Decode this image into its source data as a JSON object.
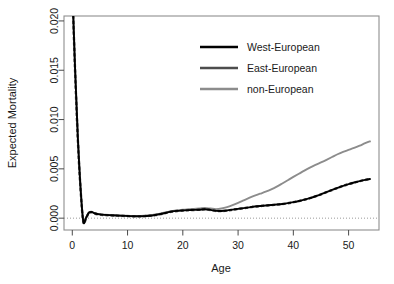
{
  "chart_data": {
    "type": "line",
    "title": "",
    "xlabel": "Age",
    "ylabel": "Expected Mortality",
    "xlim": [
      -1.5,
      55.5
    ],
    "ylim": [
      -0.0012,
      0.0205
    ],
    "xticks": [
      0,
      10,
      20,
      30,
      40,
      50
    ],
    "xtick_labels": [
      "0",
      "10",
      "20",
      "30",
      "40",
      "50"
    ],
    "yticks": [
      0.0,
      0.005,
      0.01,
      0.015,
      0.02
    ],
    "ytick_labels": [
      "0.000",
      "0.005",
      "0.010",
      "0.015",
      "0.020"
    ],
    "grid": false,
    "reference_line": {
      "y": 0.0,
      "style": "dotted",
      "color": "#9a9a9a"
    },
    "legend": {
      "position": "top-center-right",
      "entries": [
        "West-European",
        "East-European",
        "non-European"
      ]
    },
    "x": [
      0,
      0.5,
      1,
      1.5,
      2,
      2.5,
      3,
      3.5,
      4,
      5,
      6,
      7,
      8,
      9,
      10,
      11,
      12,
      13,
      14,
      15,
      16,
      17,
      18,
      19,
      20,
      21,
      22,
      23,
      24,
      25,
      26,
      27,
      28,
      29,
      30,
      31,
      32,
      33,
      34,
      35,
      36,
      37,
      38,
      39,
      40,
      41,
      42,
      43,
      44,
      45,
      46,
      47,
      48,
      49,
      50,
      51,
      52,
      53,
      54
    ],
    "series": [
      {
        "name": "West-European",
        "color": "#000000",
        "style": "solid",
        "values": [
          0.0235,
          0.0152,
          0.0082,
          0.003,
          -0.00035,
          5e-05,
          0.00055,
          0.00062,
          0.0005,
          0.00038,
          0.00033,
          0.0003,
          0.00027,
          0.00024,
          0.00022,
          0.0002,
          0.00019,
          0.00021,
          0.00025,
          0.00032,
          0.00042,
          0.00055,
          0.00067,
          0.00074,
          0.00078,
          0.00082,
          0.00084,
          0.00086,
          0.00091,
          0.00084,
          0.00074,
          0.00073,
          0.00078,
          0.00086,
          0.00094,
          0.00102,
          0.0011,
          0.00118,
          0.00124,
          0.00129,
          0.00133,
          0.00138,
          0.00144,
          0.00152,
          0.00162,
          0.00174,
          0.00188,
          0.00204,
          0.00222,
          0.00242,
          0.00264,
          0.00286,
          0.00308,
          0.00328,
          0.00346,
          0.00362,
          0.00376,
          0.00388,
          0.00398
        ]
      },
      {
        "name": "East-European",
        "color": "#4d4d4d",
        "style": "dashed",
        "values": [
          0.0233,
          0.015,
          0.008,
          0.0029,
          -0.0004,
          2e-05,
          0.00052,
          0.0006,
          0.00048,
          0.00036,
          0.00031,
          0.00028,
          0.00026,
          0.00023,
          0.00021,
          0.00019,
          0.00018,
          0.0002,
          0.00024,
          0.00031,
          0.00041,
          0.00054,
          0.00066,
          0.00073,
          0.00077,
          0.00081,
          0.00083,
          0.00085,
          0.0009,
          0.00083,
          0.00073,
          0.00072,
          0.00077,
          0.00085,
          0.00093,
          0.00101,
          0.00109,
          0.00117,
          0.00123,
          0.00128,
          0.00132,
          0.00137,
          0.00143,
          0.00151,
          0.00161,
          0.00173,
          0.00187,
          0.00203,
          0.00221,
          0.00241,
          0.00263,
          0.00285,
          0.00307,
          0.00327,
          0.00345,
          0.00361,
          0.00375,
          0.00387,
          0.00397
        ]
      },
      {
        "name": "non-European",
        "color": "#8c8c8c",
        "style": "solid",
        "values": [
          0.0237,
          0.0153,
          0.0083,
          0.0031,
          -0.0003,
          8e-05,
          0.00058,
          0.00065,
          0.00052,
          0.0004,
          0.00035,
          0.00032,
          0.00029,
          0.00026,
          0.00024,
          0.00022,
          0.00021,
          0.00024,
          0.00029,
          0.00037,
          0.00048,
          0.0006,
          0.00072,
          0.0008,
          0.00085,
          0.0009,
          0.00094,
          0.00098,
          0.00103,
          0.00098,
          0.00092,
          0.00098,
          0.00112,
          0.00132,
          0.00155,
          0.0018,
          0.00205,
          0.00228,
          0.00248,
          0.00268,
          0.00292,
          0.0032,
          0.00352,
          0.00385,
          0.00418,
          0.0045,
          0.00482,
          0.00512,
          0.0054,
          0.00565,
          0.00592,
          0.0062,
          0.00648,
          0.00672,
          0.00692,
          0.00712,
          0.00735,
          0.0076,
          0.00782
        ]
      }
    ]
  }
}
